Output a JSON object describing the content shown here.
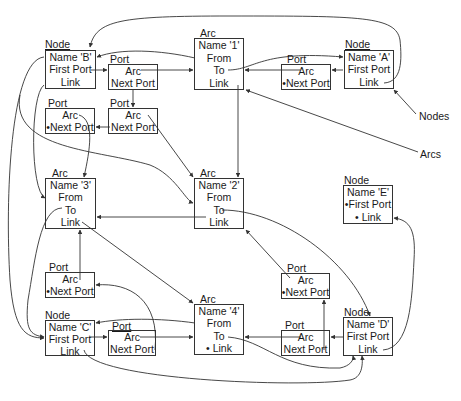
{
  "diagram": {
    "labels": {
      "nodes": "Nodes",
      "arcs": "Arcs"
    },
    "nodes": [
      {
        "id": "B",
        "title": "Node",
        "fields": [
          "Name 'B'",
          "First Port",
          "Link"
        ]
      },
      {
        "id": "A",
        "title": "Node",
        "fields": [
          "Name 'A'",
          "First Port",
          "Link"
        ]
      },
      {
        "id": "E",
        "title": "Node",
        "fields": [
          "Name 'E'",
          "•First Port",
          "•    Link"
        ]
      },
      {
        "id": "C",
        "title": "Node",
        "fields": [
          "Name 'C'",
          "First Port",
          "Link"
        ]
      },
      {
        "id": "D",
        "title": "Node",
        "fields": [
          "Name 'D'",
          "First Port",
          "Link"
        ]
      }
    ],
    "arcs": [
      {
        "id": "1",
        "title": "Arc",
        "fields": [
          "Name '1'",
          "From",
          "To",
          "Link"
        ]
      },
      {
        "id": "2",
        "title": "Arc",
        "fields": [
          "Name '2'",
          "From",
          "To",
          "Link"
        ]
      },
      {
        "id": "3",
        "title": "Arc",
        "fields": [
          "Name '3'",
          "From",
          "To",
          "Link"
        ]
      },
      {
        "id": "4",
        "title": "Arc",
        "fields": [
          "Name '4'",
          "From",
          "To",
          "•  Link"
        ]
      }
    ],
    "ports": [
      {
        "id": "pB1",
        "title": "Port",
        "fields": [
          "Arc",
          "Next Port"
        ]
      },
      {
        "id": "pB2",
        "title": "Port",
        "fields": [
          "Arc",
          "Next Port"
        ]
      },
      {
        "id": "pB3",
        "title": "Port",
        "fields": [
          "Arc",
          "•Next Port"
        ]
      },
      {
        "id": "pA1",
        "title": "Port",
        "fields": [
          "Arc",
          "•Next Port"
        ]
      },
      {
        "id": "pC2",
        "title": "Port",
        "fields": [
          "Arc",
          "•Next Port"
        ]
      },
      {
        "id": "pC1",
        "title": "Port",
        "fields": [
          "Arc",
          "Next Port"
        ]
      },
      {
        "id": "pD2",
        "title": "Port",
        "fields": [
          "Arc",
          "•Next Port"
        ]
      },
      {
        "id": "pD1",
        "title": "Port",
        "fields": [
          "Arc",
          "Next Port"
        ]
      }
    ],
    "colors": {
      "line": "#333333",
      "text": "#1a1a1a",
      "background": "#ffffff"
    }
  }
}
